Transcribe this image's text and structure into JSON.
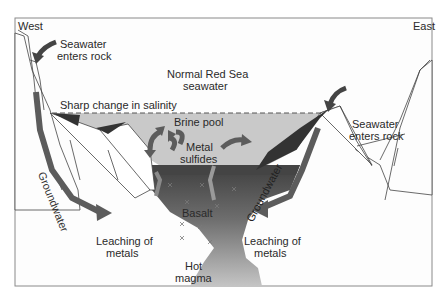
{
  "diagram": {
    "colors": {
      "frame": "#8a8a8a",
      "background": "#fdfdfd",
      "brine_pool": "#c9c9c9",
      "dark_layer": "#4a4a4a",
      "arrow": "#5c5c5c",
      "basalt_top": "#555555",
      "magma_bottom": "#bdbdbd",
      "rock": "#ffffff"
    },
    "labels": {
      "west": "West",
      "east": "East",
      "seawater_west_line1": "Seawater",
      "seawater_west_line2": "enters rock",
      "seawater_east_line1": "Seawater",
      "seawater_east_line2": "enters rock",
      "normal_line1": "Normal Red Sea",
      "normal_line2": "seawater",
      "salinity": "Sharp change in salinity",
      "brine_pool": "Brine pool",
      "metal_line1": "Metal",
      "metal_line2": "sulfides",
      "groundwater_west": "Groundwater",
      "groundwater_east": "Groundwater",
      "basalt": "Basalt",
      "leach_west_line1": "Leaching of",
      "leach_west_line2": "metals",
      "leach_east_line1": "Leaching of",
      "leach_east_line2": "metals",
      "magma_line1": "Hot",
      "magma_line2": "magma"
    }
  }
}
